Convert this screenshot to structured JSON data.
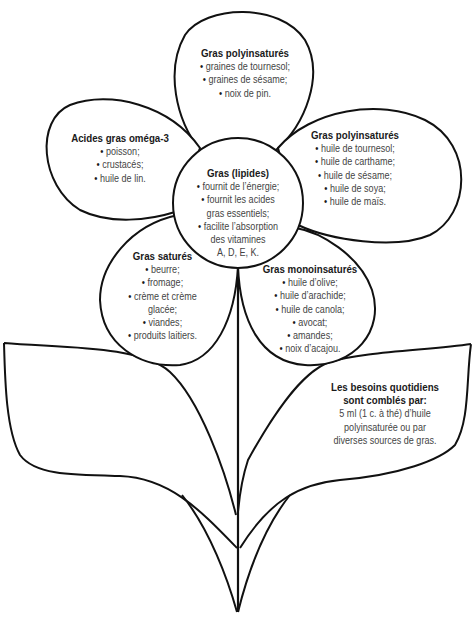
{
  "diagram": {
    "type": "flower",
    "center": {
      "title": "Gras (lipides)",
      "lines": [
        {
          "text": "fournit de l’énergie;",
          "bullet": true
        },
        {
          "text": "fournit les acides",
          "bullet": true
        },
        {
          "text": "gras essentiels;",
          "bullet": false
        },
        {
          "text": "facilite l’absorption",
          "bullet": true
        },
        {
          "text": "des vitamines",
          "bullet": false
        },
        {
          "text": "A, D, E, K.",
          "bullet": false
        }
      ]
    },
    "petals": [
      {
        "position": "top",
        "title": "Gras polyinsaturés",
        "items": [
          "graines de tournesol;",
          "graines de sésame;",
          "noix de pin."
        ]
      },
      {
        "position": "left",
        "title": "Acides gras oméga-3",
        "items": [
          "poisson;",
          "crustacés;",
          "huile de lin."
        ]
      },
      {
        "position": "right",
        "title": "Gras polyinsaturés",
        "items": [
          "huile de tournesol;",
          "huile de carthame;",
          "huile de sésame;",
          "huile de soya;",
          "huile de maïs."
        ]
      },
      {
        "position": "bottom-left",
        "title": "Gras saturés",
        "lines": [
          {
            "text": "beurre;",
            "bullet": true
          },
          {
            "text": "fromage;",
            "bullet": true
          },
          {
            "text": "crème et crème",
            "bullet": true
          },
          {
            "text": "glacée;",
            "bullet": false
          },
          {
            "text": "viandes;",
            "bullet": true
          },
          {
            "text": "produits laitiers.",
            "bullet": true
          }
        ]
      },
      {
        "position": "bottom-right",
        "title": "Gras monoinsaturés",
        "items": [
          "huile d’olive;",
          "huile d’arachide;",
          "huile de canola;",
          "avocat;",
          "amandes;",
          "noix d’acajou."
        ]
      }
    ],
    "leaf_right": {
      "title_line1": "Les besoins quotidiens",
      "title_line2": "sont comblés par:",
      "lines": [
        "5 ml (1 c. à thé) d’huile",
        "polyinsaturée ou par",
        "diverses sources de gras."
      ]
    },
    "leaf_left": {},
    "colors": {
      "stroke": "#111111",
      "background": "#ffffff",
      "text": "#444444",
      "title": "#1a1a1a"
    }
  }
}
